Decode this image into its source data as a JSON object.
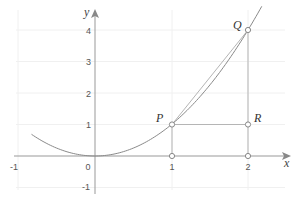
{
  "diagram": {
    "title": "",
    "function": "y = x^2",
    "axes": {
      "x_label": "x",
      "y_label": "y",
      "x_ticks": [
        {
          "value": -1,
          "label": "-1"
        },
        {
          "value": 0,
          "label": "0"
        },
        {
          "value": 1,
          "label": "1"
        },
        {
          "value": 2,
          "label": "2"
        }
      ],
      "y_ticks": [
        {
          "value": -1,
          "label": "-1"
        },
        {
          "value": 1,
          "label": "1"
        },
        {
          "value": 2,
          "label": "2"
        },
        {
          "value": 3,
          "label": "3"
        },
        {
          "value": 4,
          "label": "4"
        }
      ],
      "x_range": [
        -1.2,
        2.5
      ],
      "y_range": [
        -1.3,
        4.7
      ],
      "grid": true
    },
    "points": {
      "P": {
        "label": "P",
        "x": 1,
        "y": 1
      },
      "Q": {
        "label": "Q",
        "x": 2,
        "y": 4
      },
      "R": {
        "label": "R",
        "x": 2,
        "y": 1
      },
      "foot1": {
        "x": 1,
        "y": 0
      },
      "foot2": {
        "x": 2,
        "y": 0
      }
    },
    "segments": [
      {
        "name": "secant-PQ",
        "from": "P",
        "to": "Q"
      },
      {
        "name": "segment-PR",
        "from": "P",
        "to": "R"
      },
      {
        "name": "segment-RQ",
        "from": "R",
        "to": "Q"
      },
      {
        "name": "drop-P",
        "from": "P",
        "to": "foot1"
      },
      {
        "name": "drop-R",
        "from": "R",
        "to": "foot2"
      }
    ],
    "colors": {
      "curve": "#8a8a8a",
      "lines": "#aaaaaa",
      "axis": "#999999",
      "grid": "#f0f0f0",
      "text": "#333333"
    }
  }
}
